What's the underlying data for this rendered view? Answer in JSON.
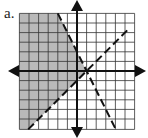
{
  "label": "a.",
  "graph": {
    "x_range": [
      -6,
      6
    ],
    "y_range": [
      -6,
      6
    ],
    "grid_spacing_px": 9.6,
    "origin_px": [
      77,
      71
    ],
    "shade_color": "#b9b9b9",
    "line_color": "#111111",
    "boundaries": [
      {
        "equation": "y = -2x + 2",
        "style": "dashed"
      },
      {
        "equation": "y = x - 1",
        "style": "dashed"
      }
    ],
    "shaded_region": "y > x - 1 and y < -2x + 2"
  }
}
